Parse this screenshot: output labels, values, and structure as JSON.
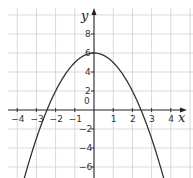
{
  "chart_data": {
    "type": "line",
    "title": "",
    "function": "y = 6 - x^2",
    "xlabel": "x",
    "ylabel": "y",
    "xlim": [
      -4.5,
      4.6
    ],
    "ylim": [
      -7.2,
      10.6
    ],
    "grid": true,
    "x_ticks": [
      -4,
      -3,
      -2,
      -1,
      1,
      2,
      3,
      4
    ],
    "y_ticks": [
      -6,
      -4,
      -2,
      2,
      4,
      6,
      8
    ],
    "origin_label": "0",
    "series": [
      {
        "name": "parabola",
        "x": [
          -3.7,
          -3.5,
          -3,
          -2.5,
          -2,
          -1.5,
          -1,
          -0.5,
          0,
          0.5,
          1,
          1.5,
          2,
          2.5,
          3,
          3.5,
          3.7
        ],
        "y": [
          -7.69,
          -6.25,
          -3,
          -0.25,
          2,
          3.75,
          5,
          5.75,
          6,
          5.75,
          5,
          3.75,
          2,
          -0.25,
          -3,
          -6.25,
          -7.69
        ]
      }
    ],
    "vertex": [
      0,
      6
    ],
    "x_intercepts": [
      -2.45,
      2.45
    ],
    "colors": {
      "grid": "#cfcfcf",
      "axis": "#222222",
      "curve": "#333333"
    }
  }
}
